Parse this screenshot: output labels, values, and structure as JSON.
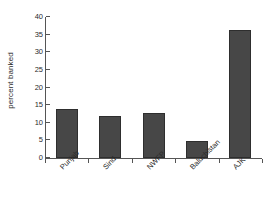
{
  "chart_data": {
    "type": "bar",
    "title": "",
    "xlabel": "",
    "ylabel": "percent banked",
    "categories": [
      "Punjab",
      "Sind",
      "NWFP",
      "Baluchistan",
      "AJK"
    ],
    "values": [
      14.0,
      12.0,
      12.8,
      4.8,
      36.3
    ],
    "ylim": [
      0,
      40
    ],
    "yticks": [
      0,
      5,
      10,
      15,
      20,
      25,
      30,
      35,
      40
    ],
    "ytick_labels": [
      "0",
      "5",
      "10",
      "15",
      "20",
      "25",
      "30",
      "35",
      "40"
    ],
    "grid": false,
    "legend": false,
    "bar_color": "#474747",
    "bar_edge_color": "#2e2e2e",
    "axis_color": "#555555",
    "background_color": "#ffffff",
    "xtick_label_rotation": -45
  }
}
